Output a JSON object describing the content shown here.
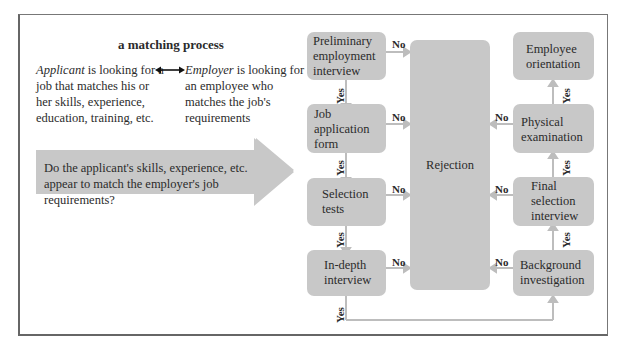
{
  "title": "a matching process",
  "applicant": {
    "emph": "Applicant",
    "rest": " is looking for a job that matches his or her skills, experience, education, training, etc."
  },
  "employer": {
    "emph": "Employer",
    "rest": " is looking for an employee who matches the job's requirements"
  },
  "question": "Do the applicant's skills, experience, etc. appear to match the employer's job requirements?",
  "steps_left": [
    "Preliminary employment interview",
    "Job application form",
    "Selection tests",
    "In-depth interview"
  ],
  "steps_right": [
    "Employee orientation",
    "Physical examination",
    "Final selection interview",
    "Background investigation"
  ],
  "rejection": "Rejection",
  "labels": {
    "no": "No",
    "yes": "Yes"
  },
  "colors": {
    "box": "#c8c8c8",
    "line": "#bdbdbd",
    "text": "#2b2b2b",
    "frame": "#777777"
  }
}
